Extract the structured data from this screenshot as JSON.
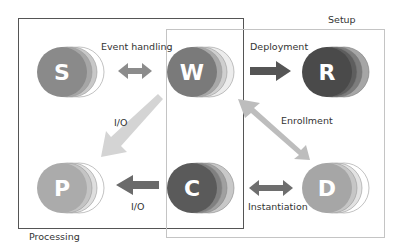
{
  "groups": {
    "processing": {
      "label": "Processing"
    },
    "setup": {
      "label": "Setup"
    }
  },
  "nodes": [
    {
      "id": "S",
      "letter": "S",
      "color": "#8a8a8a",
      "layers": [
        "#ffffff",
        "#c8c8c8",
        "#a6a6a6"
      ]
    },
    {
      "id": "W",
      "letter": "W",
      "color": "#7a7a7a",
      "layers": [
        "#ececec",
        "#cfcfcf",
        "#a8a8a8"
      ]
    },
    {
      "id": "R",
      "letter": "R",
      "color": "#4a4a4a",
      "layers": [
        "#a6a6a6",
        "#7c7c7c",
        "#5e5e5e"
      ]
    },
    {
      "id": "P",
      "letter": "P",
      "color": "#ababab",
      "layers": [
        "#ffffff",
        "#dedede",
        "#c4c4c4"
      ]
    },
    {
      "id": "C",
      "letter": "C",
      "color": "#5a5a5a",
      "layers": [
        "#c8c8c8",
        "#a0a0a0",
        "#808080"
      ]
    },
    {
      "id": "D",
      "letter": "D",
      "color": "#a6a6a6",
      "layers": [
        "#ffffff",
        "#e2e2e2",
        "#c6c6c6"
      ]
    }
  ],
  "edges": [
    {
      "from": "S",
      "to": "W",
      "label": "Event handling",
      "direction": "both"
    },
    {
      "from": "W",
      "to": "R",
      "label": "Deployment",
      "direction": "forward"
    },
    {
      "from": "W",
      "to": "P",
      "label": "I/O",
      "direction": "forward"
    },
    {
      "from": "C",
      "to": "P",
      "label": "I/O",
      "direction": "forward"
    },
    {
      "from": "D",
      "to": "W",
      "label": "Enrollment",
      "direction": "both"
    },
    {
      "from": "C",
      "to": "D",
      "label": "Instantiation",
      "direction": "both"
    }
  ]
}
